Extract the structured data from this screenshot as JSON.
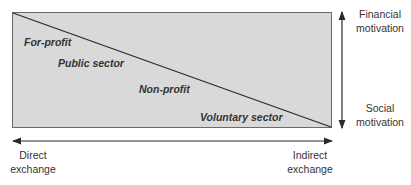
{
  "diagram": {
    "regions": {
      "for_profit": "For-profit",
      "public_sector": "Public sector",
      "non_profit": "Non-profit",
      "voluntary_sector": "Voluntary sector"
    },
    "vertical_axis": {
      "top_label": [
        "Financial",
        "motivation"
      ],
      "bottom_label": [
        "Social",
        "motivation"
      ]
    },
    "horizontal_axis": {
      "left_label": [
        "Direct",
        "exchange"
      ],
      "right_label": [
        "Indirect",
        "exchange"
      ]
    },
    "colors": {
      "box_fill": "#d9d9d9",
      "line": "#2a2a2a"
    }
  }
}
